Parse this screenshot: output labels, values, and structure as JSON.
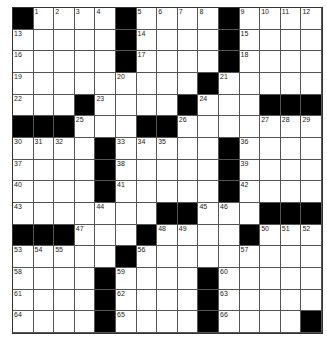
{
  "puzzle": {
    "rows": 15,
    "cols": 15,
    "grid": [
      [
        "#",
        "1",
        "2",
        "3",
        "4",
        "#",
        "5",
        "6",
        "7",
        "8",
        "#",
        "9",
        "10",
        "11",
        "12"
      ],
      [
        "13",
        "",
        "",
        "",
        "",
        "#",
        "14",
        "",
        "",
        "",
        "#",
        "15",
        "",
        "",
        ""
      ],
      [
        "16",
        "",
        "",
        "",
        "",
        "#",
        "17",
        "",
        "",
        "",
        "#",
        "18",
        "",
        "",
        ""
      ],
      [
        "19",
        "",
        "",
        "",
        "",
        "20",
        "",
        "",
        "",
        "#",
        "21",
        "",
        "",
        "",
        ""
      ],
      [
        "22",
        "",
        "",
        "#",
        "23",
        "",
        "",
        "",
        "#",
        "24",
        "",
        "",
        "#",
        "#",
        "#"
      ],
      [
        "#",
        "#",
        "#",
        "25",
        "",
        "",
        "#",
        "#",
        "26",
        "",
        "",
        "",
        "27",
        "28",
        "29"
      ],
      [
        "30",
        "31",
        "32",
        "",
        "#",
        "33",
        "34",
        "35",
        "",
        "",
        "#",
        "36",
        "",
        "",
        ""
      ],
      [
        "37",
        "",
        "",
        "",
        "#",
        "38",
        "",
        "",
        "",
        "",
        "#",
        "39",
        "",
        "",
        ""
      ],
      [
        "40",
        "",
        "",
        "",
        "#",
        "41",
        "",
        "",
        "",
        "",
        "#",
        "42",
        "",
        "",
        ""
      ],
      [
        "43",
        "",
        "",
        "",
        "44",
        "",
        "",
        "#",
        "#",
        "45",
        "46",
        "",
        "#",
        "#",
        "#"
      ],
      [
        "#",
        "#",
        "#",
        "47",
        "",
        "",
        "#",
        "48",
        "49",
        "",
        "",
        "#",
        "50",
        "51",
        "52"
      ],
      [
        "53",
        "54",
        "55",
        "",
        "",
        "#",
        "56",
        "",
        "",
        "",
        "",
        "57",
        "",
        "",
        ""
      ],
      [
        "58",
        "",
        "",
        "",
        "#",
        "59",
        "",
        "",
        "",
        "#",
        "60",
        "",
        "",
        "",
        ""
      ],
      [
        "61",
        "",
        "",
        "",
        "#",
        "62",
        "",
        "",
        "",
        "#",
        "63",
        "",
        "",
        "",
        ""
      ],
      [
        "64",
        "",
        "",
        "",
        "#",
        "65",
        "",
        "",
        "",
        "#",
        "66",
        "",
        "",
        "",
        "#"
      ]
    ]
  }
}
